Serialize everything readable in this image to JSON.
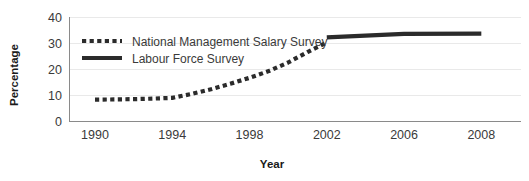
{
  "chart_data": {
    "type": "line",
    "title": "",
    "xlabel": "Year",
    "ylabel": "Percentage",
    "xlim": [
      1990,
      2008
    ],
    "ylim": [
      0,
      40
    ],
    "yticks": [
      0,
      10,
      20,
      30,
      40
    ],
    "ytick_labels": [
      "0",
      "10",
      "20",
      "30",
      "40"
    ],
    "xticks": [
      1990,
      1994,
      1998,
      2002,
      2006,
      2008
    ],
    "xtick_labels": [
      "1990",
      "1994",
      "1998",
      "2002",
      "2006",
      "2008"
    ],
    "grid": "horizontal",
    "legend_position": "top-left-inside",
    "series": [
      {
        "name": "National Management Salary Survey",
        "style": "dotted",
        "color": "#2b2b2b",
        "x": [
          1990,
          1991,
          1992,
          1993,
          1994,
          1995,
          1996,
          1997,
          1998,
          1999,
          2000,
          2001,
          2002
        ],
        "values": [
          8.2,
          8.3,
          8.4,
          8.6,
          8.9,
          10.4,
          12.2,
          14.3,
          16.6,
          19.2,
          22.5,
          26.5,
          30.2
        ]
      },
      {
        "name": "Labour Force Survey",
        "style": "solid",
        "color": "#2b2b2b",
        "x": [
          2002,
          2006,
          2008
        ],
        "values": [
          32.2,
          33.5,
          33.6
        ]
      }
    ]
  },
  "legend": {
    "entries": [
      {
        "label": "National Management Salary Survey",
        "style": "dotted"
      },
      {
        "label": "Labour Force Survey",
        "style": "solid"
      }
    ]
  },
  "colors": {
    "series": "#2b2b2b",
    "gridline": "#e9e9e9",
    "axis": "#8a8a8a",
    "text": "#3a3a3a",
    "title_text": "#1a1a1a",
    "background": "#ffffff"
  }
}
